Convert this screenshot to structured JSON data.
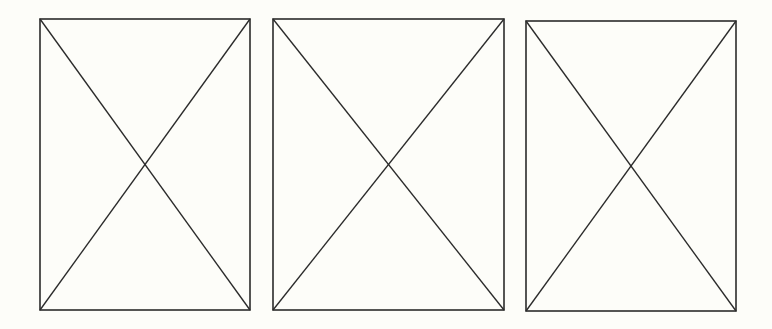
{
  "canvas": {
    "width": 772,
    "height": 329,
    "background": "#fdfdf9"
  },
  "stroke": {
    "color": "#2b2b2b",
    "width": 1.6
  },
  "placeholders": [
    {
      "name": "image-placeholder-1",
      "x": 40,
      "y": 19,
      "w": 210,
      "h": 291
    },
    {
      "name": "image-placeholder-2",
      "x": 273,
      "y": 19,
      "w": 231,
      "h": 291
    },
    {
      "name": "image-placeholder-3",
      "x": 526,
      "y": 21,
      "w": 210,
      "h": 290
    }
  ]
}
